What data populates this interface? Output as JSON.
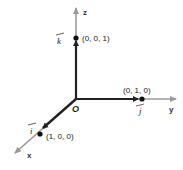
{
  "diagram": {
    "colors": {
      "axis": "#9a9a9a",
      "vector": "#222222",
      "point": "#111111",
      "background": "#ffffff"
    },
    "origin": {
      "label": "O"
    },
    "axes": [
      {
        "id": "x",
        "label": "x"
      },
      {
        "id": "y",
        "label": "y"
      },
      {
        "id": "z",
        "label": "z"
      }
    ],
    "vectors": [
      {
        "id": "i",
        "label": "i",
        "point_label": "(1, 0, 0)"
      },
      {
        "id": "j",
        "label": "j",
        "point_label": "(0, 1, 0)"
      },
      {
        "id": "k",
        "label": "k",
        "point_label": "(0, 0, 1)"
      }
    ]
  }
}
